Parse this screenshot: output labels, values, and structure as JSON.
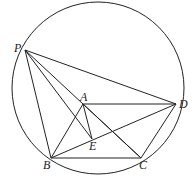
{
  "diagram": {
    "type": "geometry",
    "circle": {
      "cx": 98,
      "cy": 88,
      "r": 86
    },
    "points": {
      "P": {
        "x": 25,
        "y": 50,
        "label": "P",
        "lx": 14,
        "ly": 52
      },
      "A": {
        "x": 83,
        "y": 104,
        "label": "A",
        "lx": 80,
        "ly": 101
      },
      "D": {
        "x": 176,
        "y": 104,
        "label": "D",
        "lx": 179,
        "ly": 108
      },
      "E": {
        "x": 92,
        "y": 139,
        "label": "E",
        "lx": 89,
        "ly": 150
      },
      "B": {
        "x": 51,
        "y": 158,
        "label": "B",
        "lx": 43,
        "ly": 169
      },
      "C": {
        "x": 141,
        "y": 158,
        "label": "C",
        "lx": 139,
        "ly": 169
      }
    },
    "segments": [
      [
        "P",
        "D"
      ],
      [
        "P",
        "B"
      ],
      [
        "P",
        "E"
      ],
      [
        "P",
        "C"
      ],
      [
        "A",
        "D"
      ],
      [
        "A",
        "B"
      ],
      [
        "A",
        "E"
      ],
      [
        "A",
        "C"
      ],
      [
        "B",
        "C"
      ],
      [
        "B",
        "D"
      ],
      [
        "C",
        "D"
      ]
    ]
  }
}
